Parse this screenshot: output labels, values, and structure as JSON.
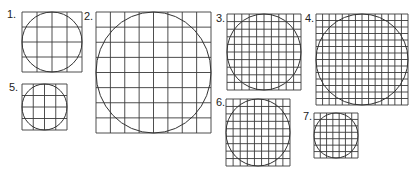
{
  "colors": {
    "line": "#3a3a3a",
    "circle": "#333333",
    "background": "#ffffff"
  },
  "figures": [
    {
      "id": 1,
      "label": "1.",
      "cells": 4,
      "shape": "circle-inscribed"
    },
    {
      "id": 2,
      "label": "2.",
      "cells": 8,
      "shape": "circle-inscribed"
    },
    {
      "id": 3,
      "label": "3.",
      "cells": 10,
      "shape": "circle-inscribed"
    },
    {
      "id": 4,
      "label": "4.",
      "cells": 14,
      "shape": "circle-inscribed"
    },
    {
      "id": 5,
      "label": "5.",
      "cells": 4,
      "shape": "circle-inscribed"
    },
    {
      "id": 6,
      "label": "6.",
      "cells": 9,
      "shape": "circle-inscribed"
    },
    {
      "id": 7,
      "label": "7.",
      "cells": 7,
      "shape": "circle-inscribed"
    }
  ]
}
